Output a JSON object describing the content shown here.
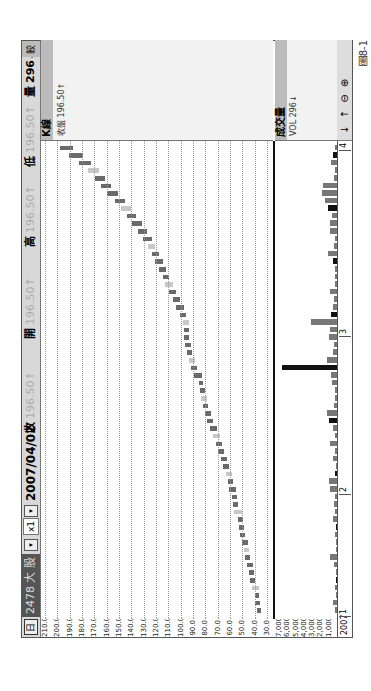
{
  "header": {
    "calendar_icon": "日",
    "stock_code": "2478",
    "stock_name": "大 股",
    "dropdown_arrow": "▾",
    "multiplier": "x1",
    "date": "2007/04/02",
    "close_label": "收",
    "close_value": "196.50↑",
    "open_label": "開",
    "open_value": "196.50↑",
    "high_label": "高",
    "high_value": "196.50↑",
    "low_label": "低",
    "low_value": "196.50↑",
    "volume_label": "量",
    "volume_value": "296↓",
    "last_button": "較"
  },
  "price_panel": {
    "title": "K線",
    "legend_text": "收盤 196.50↑",
    "top_label": "196.5"
  },
  "volume_panel": {
    "title": "成交量",
    "legend_text": "VOL 296↓"
  },
  "xaxis": {
    "year": "2007",
    "months": [
      "1",
      "2",
      "3",
      "4"
    ]
  },
  "toolbar": {
    "down_arrow": "↓",
    "up_arrow": "↑",
    "zoom_out": "⊖",
    "zoom_in": "⊕"
  },
  "caption": "圖8-1",
  "colors": {
    "up_candle": "#6a6a6a",
    "down_candle": "#c8c8c8",
    "dark_volume": "#111111",
    "volume": "#777777",
    "header_bg": "#d8d8d8"
  },
  "chart_data": [
    {
      "type": "candlestick",
      "title": "K線",
      "ylabel": "Price",
      "ylim": [
        30,
        210
      ],
      "yticks": [
        210,
        200,
        190,
        180,
        170,
        160,
        150,
        140,
        130,
        120,
        110,
        100,
        90,
        80,
        70,
        60,
        50,
        40,
        30
      ],
      "x_months": [
        "2007-01",
        "2007-02",
        "2007-03",
        "2007-04"
      ],
      "grid": true,
      "close": [
        37,
        38,
        38,
        41,
        42,
        43,
        45,
        46,
        47,
        49,
        50,
        51,
        52,
        55,
        56,
        57,
        59,
        60,
        62,
        64,
        66,
        68,
        70,
        72,
        75,
        77,
        79,
        80,
        82,
        83,
        84,
        88,
        90,
        92,
        93,
        95,
        96,
        95,
        97,
        99,
        102,
        105,
        108,
        111,
        113,
        116,
        119,
        122,
        125,
        129,
        133,
        138,
        142,
        147,
        152,
        158,
        163,
        168,
        174,
        181,
        189,
        196.5
      ],
      "last_close": 196.5
    },
    {
      "type": "bar",
      "title": "成交量",
      "ylabel": "VOL",
      "ylim": [
        0,
        7000
      ],
      "yticks": [
        "7,000",
        "6,000",
        "5,000",
        "4,000",
        "3,000",
        "2,000",
        "1,000"
      ],
      "values": [
        200,
        500,
        100,
        300,
        100,
        150,
        400,
        800,
        100,
        120,
        200,
        150,
        500,
        300,
        400,
        300,
        900,
        1000,
        200,
        100,
        500,
        250,
        800,
        300,
        500,
        1000,
        1200,
        400,
        200,
        300,
        600,
        700,
        6600,
        1200,
        500,
        400,
        1000,
        900,
        3100,
        700,
        500,
        400,
        800,
        200,
        300,
        200,
        500,
        1100,
        400,
        200,
        900,
        800,
        600,
        1100,
        1500,
        1800,
        1700,
        400,
        200,
        700,
        500,
        296
      ],
      "last_volume": 296
    }
  ]
}
